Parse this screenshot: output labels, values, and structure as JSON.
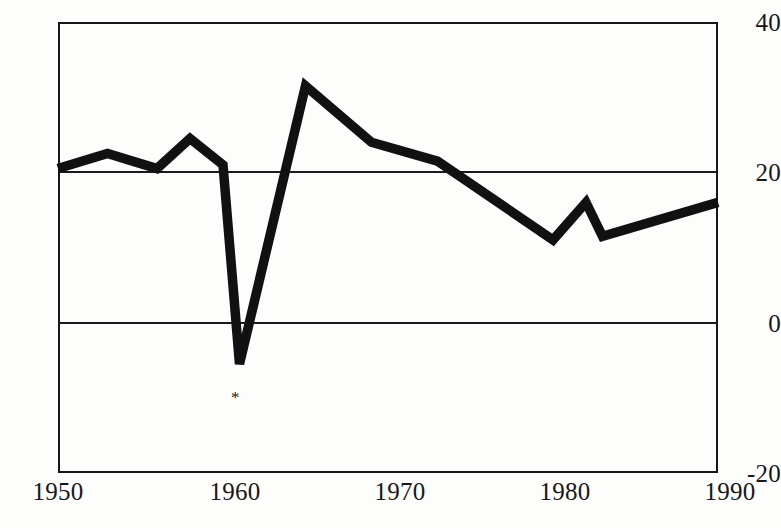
{
  "chart_data": {
    "type": "line",
    "title": "",
    "subtitle": "",
    "xlabel": "",
    "ylabel": "",
    "xlim": [
      1950,
      1990
    ],
    "ylim": [
      -20,
      40
    ],
    "grid": "horizontal gridlines at y = 0 and y = 20 only; no vertical gridlines",
    "legend": "none",
    "x_ticks": [
      "1950",
      "1960",
      "1970",
      "1980",
      "1990"
    ],
    "y_ticks": [
      "40",
      "20",
      "0",
      "-20"
    ],
    "gridline_values": [
      20,
      0
    ],
    "series": [
      {
        "name": "series-1",
        "x": [
          1950,
          1953,
          1956,
          1958,
          1960,
          1961,
          1965,
          1969,
          1973,
          1980,
          1982,
          1983,
          1990
        ],
        "values": [
          20.5,
          22.5,
          20.5,
          24.5,
          21,
          -5.5,
          31.5,
          24,
          21.5,
          11,
          16,
          11.5,
          16
        ]
      }
    ],
    "annotations": [
      {
        "name": "asterisk-footnote-marker",
        "glyph": "*",
        "x": 1961,
        "y": -10,
        "note": "asterisk placed just below the 1961 trough"
      }
    ]
  },
  "axes": {
    "y_ticks": [
      {
        "label": "40",
        "value": 40
      },
      {
        "label": "20",
        "value": 20
      },
      {
        "label": "0",
        "value": 0
      },
      {
        "label": "-20",
        "value": -20
      }
    ],
    "x_ticks": [
      {
        "label": "1950",
        "value": 1950
      },
      {
        "label": "1960",
        "value": 1960
      },
      {
        "label": "1970",
        "value": 1970
      },
      {
        "label": "1980",
        "value": 1980
      },
      {
        "label": "1990",
        "value": 1990
      }
    ]
  },
  "style": {
    "line_color": "#111114",
    "frame_color": "#17171a",
    "gridline_color": "#1b1b1e",
    "background": "#fdfdfc",
    "text_color": "#18181b"
  }
}
